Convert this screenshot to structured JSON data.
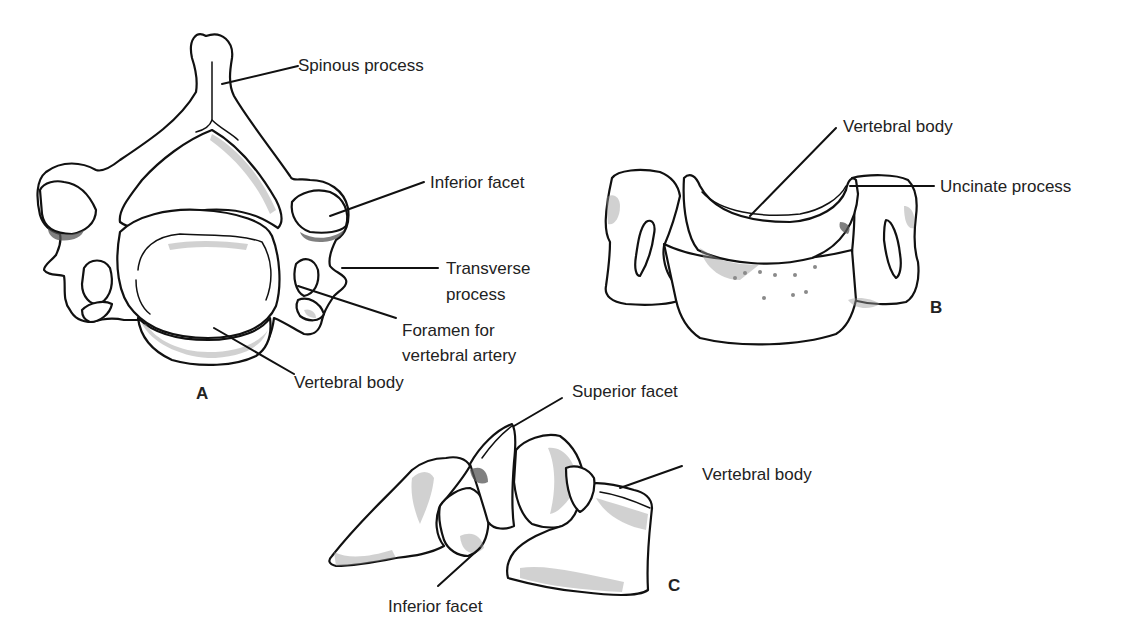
{
  "figure": {
    "views": [
      {
        "id": "A",
        "label": "A",
        "description": "superior view",
        "annotations": [
          {
            "text": "Spinous process"
          },
          {
            "text": "Inferior facet"
          },
          {
            "text": "Transverse process",
            "lines": [
              "Transverse",
              "process"
            ]
          },
          {
            "text": "Foramen for vertebral artery",
            "lines": [
              "Foramen for",
              "vertebral artery"
            ]
          },
          {
            "text": "Vertebral body"
          }
        ]
      },
      {
        "id": "B",
        "label": "B",
        "description": "anterior view",
        "annotations": [
          {
            "text": "Vertebral body"
          },
          {
            "text": "Uncinate process"
          }
        ]
      },
      {
        "id": "C",
        "label": "C",
        "description": "lateral view",
        "annotations": [
          {
            "text": "Superior facet"
          },
          {
            "text": "Vertebral body"
          },
          {
            "text": "Inferior facet"
          }
        ]
      }
    ]
  }
}
